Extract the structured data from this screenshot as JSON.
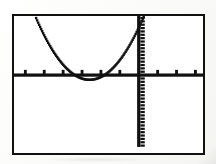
{
  "document": {
    "kind": "graphing-calculator-screen-capture",
    "background_color": "#fcfcfa"
  },
  "screen": {
    "label": "graphing-calculator-display",
    "border_color": "#111111",
    "background_color": "#ffffff",
    "pixel_color": "#111111"
  },
  "chart_data": {
    "type": "line",
    "title": "",
    "subtitle": "",
    "xlabel": "",
    "ylabel": "",
    "grid": false,
    "legend": null,
    "legend_position": "none",
    "curve_label": "parabola",
    "equation": "y = a(x - h)^2 + k",
    "axis_style": "tick-marked crosshair axes",
    "xlim": [
      -6.6,
      3.4
    ],
    "ylim": [
      -5.8,
      4.4
    ],
    "x_tick_step": 1,
    "y_tick_step": 0.25,
    "x_axis_pixel_y": 82,
    "y_axis_pixel_x": 112,
    "x_tick_count_left": 8,
    "x_tick_count_right": 7,
    "vertex": [
      -2.6,
      -0.35
    ],
    "x_intercepts": [
      -3.3,
      -1.85
    ],
    "series": [
      {
        "name": "parabola",
        "style": "dotted-pixel-trace",
        "x": [
          -5.4,
          -5.2,
          -5.0,
          -4.8,
          -4.6,
          -4.4,
          -4.2,
          -4.0,
          -3.8,
          -3.6,
          -3.4,
          -3.2,
          -3.0,
          -2.8,
          -2.6,
          -2.4,
          -2.2,
          -2.0,
          -1.8,
          -1.6,
          -1.4,
          -1.2,
          -1.0,
          -0.8,
          -0.6,
          -0.4,
          -0.2,
          0.0,
          0.15,
          0.3,
          0.45,
          0.6
        ],
        "y": [
          4.15,
          3.55,
          2.99,
          2.47,
          1.98,
          1.53,
          1.12,
          0.75,
          0.41,
          0.11,
          -0.14,
          -0.28,
          -0.34,
          -0.36,
          -0.35,
          -0.3,
          -0.18,
          0.03,
          0.3,
          0.62,
          0.99,
          1.4,
          1.86,
          2.36,
          2.9,
          3.49,
          4.12,
          4.39,
          4.39,
          4.39,
          4.39,
          4.39
        ]
      }
    ]
  }
}
